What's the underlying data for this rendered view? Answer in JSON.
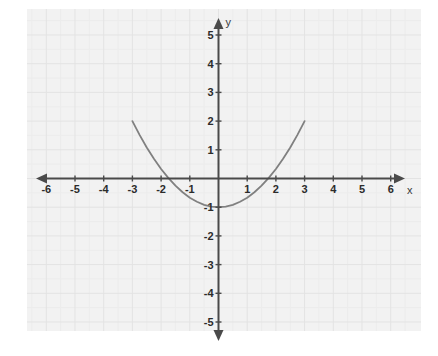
{
  "chart_data": {
    "type": "line",
    "title": "",
    "xlabel": "x",
    "ylabel": "y",
    "xlim": [
      -6.4,
      6.4
    ],
    "ylim": [
      -5.4,
      5.4
    ],
    "grid": true,
    "grid_major_step": 1,
    "grid_minor_step": 0.5,
    "legend": "none",
    "xticks": [
      -6,
      -5,
      -4,
      -3,
      -2,
      -1,
      1,
      2,
      3,
      4,
      5,
      6
    ],
    "yticks": [
      5,
      4,
      3,
      2,
      1,
      -1,
      -2,
      -3,
      -4,
      -5
    ],
    "xtick_labels": [
      "-6",
      "-5",
      "-4",
      "-3",
      "-2",
      "-1",
      "1",
      "2",
      "3",
      "4",
      "5",
      "6"
    ],
    "ytick_labels": [
      "5",
      "4",
      "3",
      "2",
      "1",
      "-1",
      "-2",
      "-3",
      "-4",
      "-5"
    ],
    "series": [
      {
        "name": "parabola",
        "color": "#808080",
        "equation": "y = x^2/3 - 1",
        "vertex": [
          0,
          -1
        ],
        "roots": [
          -1.9,
          1.9
        ],
        "domain": [
          -3,
          3
        ],
        "x": [
          -3.0,
          -2.75,
          -2.5,
          -2.25,
          -2.0,
          -1.75,
          -1.5,
          -1.25,
          -1.0,
          -0.75,
          -0.5,
          -0.25,
          0.0,
          0.25,
          0.5,
          0.75,
          1.0,
          1.25,
          1.5,
          1.75,
          2.0,
          2.25,
          2.5,
          2.75,
          3.0
        ],
        "y": [
          2.0,
          1.52,
          1.08,
          0.69,
          0.33,
          0.02,
          -0.25,
          -0.48,
          -0.67,
          -0.81,
          -0.92,
          -0.98,
          -1.0,
          -0.98,
          -0.92,
          -0.81,
          -0.67,
          -0.48,
          -0.25,
          0.02,
          0.33,
          0.69,
          1.08,
          1.52,
          2.0
        ]
      }
    ]
  },
  "axes": {
    "x_axis_label": "x",
    "y_axis_label": "y",
    "axis_color": "#4a4a4a",
    "grid_color": "#e3e3e3",
    "plot_background": "#f2f2f2",
    "page_background": "#ffffff"
  }
}
